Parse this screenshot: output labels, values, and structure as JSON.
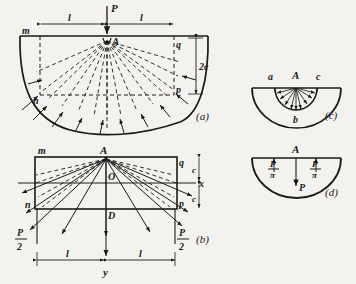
{
  "figure": {
    "background_color": "#f4f2ee",
    "ink_color": "#1a1a1a"
  },
  "panels": [
    {
      "id": "a",
      "caption": "(a)",
      "labels": {
        "load": "P",
        "apex": "A",
        "left_edge": "m",
        "left_lower": "n",
        "right_upper": "q",
        "right_lower": "p",
        "depth": "2c",
        "span_left": "l",
        "span_right": "l"
      },
      "ray_count": 14
    },
    {
      "id": "b",
      "caption": "(b)",
      "labels": {
        "apex": "A",
        "origin": "O",
        "bottom_center": "D",
        "left_edge": "m",
        "left_lower": "n",
        "right_upper": "q",
        "right_lower": "p",
        "axis_x": "x",
        "axis_y": "y",
        "half_depth_upper": "c",
        "half_depth_lower": "c",
        "span_left": "l",
        "span_right": "l",
        "reaction_left_num": "P",
        "reaction_left_den": "2",
        "reaction_right_num": "P",
        "reaction_right_den": "2"
      },
      "ray_count": 12
    },
    {
      "id": "c",
      "caption": "(c)",
      "labels": {
        "left": "a",
        "center": "A",
        "right": "c",
        "bottom": "b"
      },
      "ray_count": 9
    },
    {
      "id": "d",
      "caption": "(d)",
      "labels": {
        "center": "A",
        "load": "P",
        "left_num": "P",
        "left_den": "π",
        "right_num": "P",
        "right_den": "π"
      }
    }
  ]
}
